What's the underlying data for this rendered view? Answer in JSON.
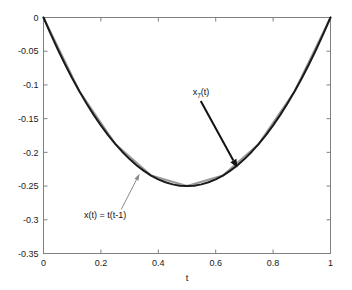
{
  "figure": {
    "background": "#ffffff",
    "plot_background": "#ffffff",
    "axis_color": "#808080",
    "exact_curve_color": "#1a1a1a",
    "approx_curve_color": "#9a9a9a",
    "arrow_dark_color": "#111111",
    "arrow_light_color": "#8a8a8a"
  },
  "axes": {
    "xlabel": "t",
    "ylabel": "",
    "xticklabels": [
      "0",
      "0.2",
      "0.4",
      "0.6",
      "0.8",
      "1"
    ],
    "yticklabels": [
      "0",
      "-0.05",
      "-0.1",
      "-0.15",
      "-0.2",
      "-0.25",
      "-0.3",
      "-0.35"
    ],
    "xlim": [
      0,
      1
    ],
    "ylim": [
      -0.35,
      0
    ],
    "box": true,
    "grid": false
  },
  "annotations": {
    "upper": {
      "base": "x",
      "subscript": "7",
      "suffix": "(t)",
      "full_text": "x7(t)"
    },
    "lower": {
      "text": "x(t) =  t(t-1)"
    }
  },
  "chart_data": {
    "type": "line",
    "title": "",
    "xlabel": "t",
    "ylabel": "",
    "xlim": [
      0,
      1
    ],
    "ylim": [
      -0.35,
      0
    ],
    "grid": false,
    "legend": "none",
    "xticks": [
      0,
      0.2,
      0.4,
      0.6,
      0.8,
      1
    ],
    "yticks": [
      0,
      -0.05,
      -0.1,
      -0.15,
      -0.2,
      -0.25,
      -0.3,
      -0.35
    ],
    "xticklabels": [
      "0",
      "0.2",
      "0.4",
      "0.6",
      "0.8",
      "1"
    ],
    "yticklabels": [
      "0",
      "-0.05",
      "-0.1",
      "-0.15",
      "-0.2",
      "-0.25",
      "-0.3",
      "-0.35"
    ],
    "annotations": [
      {
        "text": "x7(t)",
        "x": 0.52,
        "y": -0.115,
        "arrow_to_x": 0.675,
        "arrow_to_y": -0.2225
      },
      {
        "text": "x(t) =  t(t-1)",
        "x": 0.215,
        "y": -0.298,
        "arrow_to_x": 0.335,
        "arrow_to_y": -0.2315
      }
    ],
    "series": [
      {
        "name": "x(t) = t(t-1)",
        "type": "exact",
        "color": "#1a1a1a",
        "linewidth": 2,
        "x": [
          0,
          0.025,
          0.05,
          0.075,
          0.1,
          0.125,
          0.15,
          0.175,
          0.2,
          0.225,
          0.25,
          0.275,
          0.3,
          0.325,
          0.35,
          0.375,
          0.4,
          0.425,
          0.45,
          0.475,
          0.5,
          0.525,
          0.55,
          0.575,
          0.6,
          0.625,
          0.65,
          0.675,
          0.7,
          0.725,
          0.75,
          0.775,
          0.8,
          0.825,
          0.85,
          0.875,
          0.9,
          0.925,
          0.95,
          0.975,
          1
        ],
        "y": [
          0,
          -0.024375,
          -0.0475,
          -0.069375,
          -0.09,
          -0.109375,
          -0.1275,
          -0.144375,
          -0.16,
          -0.174375,
          -0.1875,
          -0.199375,
          -0.21,
          -0.219375,
          -0.2275,
          -0.234375,
          -0.24,
          -0.244375,
          -0.2475,
          -0.249375,
          -0.25,
          -0.249375,
          -0.2475,
          -0.244375,
          -0.24,
          -0.234375,
          -0.2275,
          -0.219375,
          -0.21,
          -0.199375,
          -0.1875,
          -0.174375,
          -0.16,
          -0.144375,
          -0.1275,
          -0.109375,
          -0.09,
          -0.069375,
          -0.0475,
          -0.024375,
          0
        ]
      },
      {
        "name": "x7(t)",
        "type": "piecewise-linear-approximation",
        "color": "#9a9a9a",
        "linewidth": 2,
        "x": [
          0,
          0.125,
          0.25,
          0.375,
          0.5,
          0.625,
          0.75,
          0.875,
          1
        ],
        "y": [
          0,
          -0.109375,
          -0.1875,
          -0.234375,
          -0.25,
          -0.234375,
          -0.1875,
          -0.109375,
          0
        ]
      }
    ]
  }
}
